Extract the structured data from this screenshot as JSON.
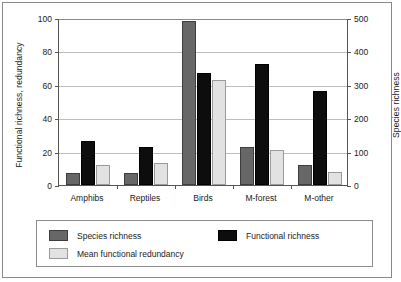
{
  "chart_data": {
    "type": "bar",
    "title": "",
    "subtitle": "",
    "xlabel": "",
    "ylabel": "Functional richness, redundancy",
    "y2label": "Species richness",
    "categories": [
      "Amphibs",
      "Reptiles",
      "Birds",
      "M-forest",
      "M-other"
    ],
    "series": [
      {
        "name": "Species richness",
        "axis": "right",
        "color": "#676767",
        "values": [
          35,
          35,
          490,
          115,
          60
        ]
      },
      {
        "name": "Functional richness",
        "axis": "left",
        "color": "#0d0d0d",
        "values": [
          26.5,
          23,
          67,
          72.5,
          56
        ]
      },
      {
        "name": "Mean functional redundancy",
        "axis": "left",
        "color": "#e2e2e2",
        "values": [
          12,
          13,
          63,
          21,
          8
        ]
      }
    ],
    "ylim": [
      0,
      100
    ],
    "yticks": [
      0,
      20,
      40,
      60,
      80,
      100
    ],
    "y2lim": [
      0,
      500
    ],
    "y2ticks": [
      0,
      100,
      200,
      300,
      400,
      500
    ],
    "grid": true,
    "legend_position": "bottom",
    "legend_entries": [
      "Species richness",
      "Functional richness",
      "Mean functional redundancy"
    ]
  },
  "axes": {
    "left_title": "Functional richness, redundancy",
    "right_title": "Species richness",
    "left_ticks": [
      "0",
      "20",
      "40",
      "60",
      "80",
      "100"
    ],
    "right_ticks": [
      "0",
      "100",
      "200",
      "300",
      "400",
      "500"
    ]
  },
  "legend": {
    "items": [
      {
        "label": "Species richness",
        "swatch": "species"
      },
      {
        "label": "Functional richness",
        "swatch": "functional"
      },
      {
        "label": "Mean functional redundancy",
        "swatch": "redundancy"
      }
    ]
  }
}
